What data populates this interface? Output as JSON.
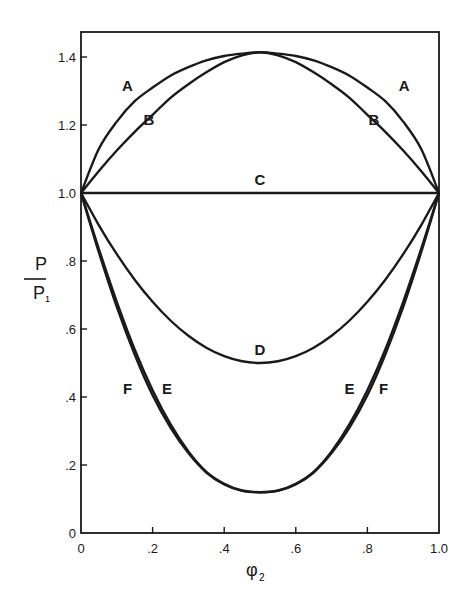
{
  "chart_data": {
    "type": "line",
    "title": "",
    "xlabel": "φ2",
    "ylabel": "P / P1",
    "xlim": [
      0,
      1.0
    ],
    "ylim": [
      0,
      1.47
    ],
    "grid": false,
    "x_ticks": [
      {
        "v": 0,
        "label": "0"
      },
      {
        "v": 0.2,
        "label": ".2"
      },
      {
        "v": 0.4,
        "label": ".4"
      },
      {
        "v": 0.6,
        "label": ".6"
      },
      {
        "v": 0.8,
        "label": ".8"
      },
      {
        "v": 1.0,
        "label": "1.0"
      }
    ],
    "y_ticks": [
      {
        "v": 0,
        "label": "0"
      },
      {
        "v": 0.2,
        "label": ".2"
      },
      {
        "v": 0.4,
        "label": ".4"
      },
      {
        "v": 0.6,
        "label": ".6"
      },
      {
        "v": 0.8,
        "label": ".8"
      },
      {
        "v": 1.0,
        "label": "1.0"
      },
      {
        "v": 1.2,
        "label": "1.2"
      },
      {
        "v": 1.4,
        "label": "1.4"
      }
    ],
    "x": [
      0,
      0.05,
      0.1,
      0.15,
      0.2,
      0.25,
      0.3,
      0.35,
      0.4,
      0.45,
      0.5,
      0.55,
      0.6,
      0.65,
      0.7,
      0.75,
      0.8,
      0.85,
      0.9,
      0.95,
      1.0
    ],
    "series": [
      {
        "name": "A",
        "values": [
          1.0,
          1.13,
          1.21,
          1.27,
          1.31,
          1.345,
          1.37,
          1.39,
          1.403,
          1.41,
          1.414,
          1.41,
          1.403,
          1.39,
          1.37,
          1.345,
          1.31,
          1.27,
          1.21,
          1.13,
          1.0
        ]
      },
      {
        "name": "B",
        "values": [
          1.0,
          1.065,
          1.125,
          1.18,
          1.23,
          1.28,
          1.32,
          1.355,
          1.385,
          1.405,
          1.414,
          1.405,
          1.385,
          1.355,
          1.32,
          1.28,
          1.23,
          1.18,
          1.125,
          1.065,
          1.0
        ]
      },
      {
        "name": "C",
        "values": [
          1.0,
          1.0,
          1.0,
          1.0,
          1.0,
          1.0,
          1.0,
          1.0,
          1.0,
          1.0,
          1.0,
          1.0,
          1.0,
          1.0,
          1.0,
          1.0,
          1.0,
          1.0,
          1.0,
          1.0,
          1.0
        ]
      },
      {
        "name": "D",
        "values": [
          1.0,
          0.905,
          0.82,
          0.745,
          0.68,
          0.625,
          0.58,
          0.545,
          0.52,
          0.505,
          0.5,
          0.505,
          0.52,
          0.545,
          0.58,
          0.625,
          0.68,
          0.745,
          0.82,
          0.905,
          1.0
        ]
      },
      {
        "name": "E",
        "values": [
          1.0,
          0.835,
          0.68,
          0.54,
          0.42,
          0.32,
          0.24,
          0.18,
          0.145,
          0.125,
          0.12,
          0.125,
          0.145,
          0.18,
          0.24,
          0.32,
          0.42,
          0.54,
          0.68,
          0.835,
          1.0
        ]
      },
      {
        "name": "F",
        "values": [
          1.0,
          0.825,
          0.665,
          0.525,
          0.405,
          0.31,
          0.235,
          0.178,
          0.143,
          0.124,
          0.12,
          0.124,
          0.143,
          0.178,
          0.235,
          0.31,
          0.405,
          0.525,
          0.665,
          0.825,
          1.0
        ]
      }
    ],
    "annotations": [
      {
        "text": "A",
        "x": 0.13,
        "y": 1.3
      },
      {
        "text": "B",
        "x": 0.19,
        "y": 1.2
      },
      {
        "text": "A",
        "x": 0.903,
        "y": 1.3
      },
      {
        "text": "B",
        "x": 0.818,
        "y": 1.2
      },
      {
        "text": "C",
        "x": 0.5,
        "y": 1.025
      },
      {
        "text": "D",
        "x": 0.5,
        "y": 0.525
      },
      {
        "text": "F",
        "x": 0.13,
        "y": 0.41
      },
      {
        "text": "E",
        "x": 0.24,
        "y": 0.41
      },
      {
        "text": "E",
        "x": 0.75,
        "y": 0.41
      },
      {
        "text": "F",
        "x": 0.845,
        "y": 0.41
      }
    ]
  },
  "axes": {
    "x_label_main": "φ",
    "x_label_sub": "2",
    "y_label_num": "P",
    "y_label_den": "P",
    "y_label_den_sub": "1"
  }
}
